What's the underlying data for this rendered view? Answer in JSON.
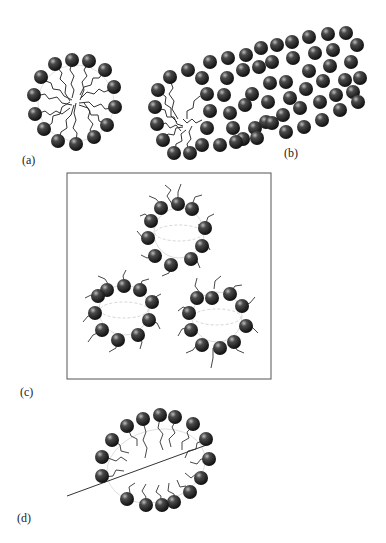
{
  "figure": {
    "panels": [
      {
        "id": "a",
        "label": "(a)",
        "caption": "spherical micelle"
      },
      {
        "id": "b",
        "label": "(b)",
        "caption": "cylindrical micelle"
      },
      {
        "id": "c",
        "label": "(c)",
        "caption": "vesicle cluster in box"
      },
      {
        "id": "d",
        "label": "(d)",
        "caption": "micelle threaded by polymer chain"
      }
    ]
  },
  "colors": {
    "headgroup": "#1a1a1a",
    "tail": "#333333",
    "guide": "#bbbbbb",
    "frame": "#555555"
  }
}
